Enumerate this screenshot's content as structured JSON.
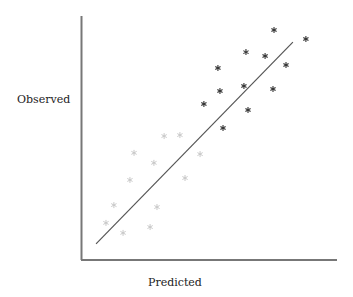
{
  "chart_data": {
    "type": "scatter",
    "title": "",
    "xlabel": "Predicted",
    "ylabel": "Observed",
    "xlim": [
      0,
      10
    ],
    "ylim": [
      0,
      10
    ],
    "grid": false,
    "ticks": "none",
    "legend": null,
    "marker": "asterisk",
    "series": [
      {
        "name": "dark points",
        "color": "#333333",
        "points": [
          [
            7.53,
            9.43
          ],
          [
            8.78,
            9.06
          ],
          [
            6.43,
            8.52
          ],
          [
            7.18,
            8.36
          ],
          [
            8.0,
            7.99
          ],
          [
            5.33,
            7.87
          ],
          [
            5.41,
            6.93
          ],
          [
            6.35,
            7.13
          ],
          [
            7.49,
            7.01
          ],
          [
            4.78,
            6.39
          ],
          [
            6.51,
            6.15
          ],
          [
            5.53,
            5.41
          ]
        ]
      },
      {
        "name": "light points",
        "color": "#c8c8c8",
        "points": [
          [
            3.22,
            5.08
          ],
          [
            3.84,
            5.12
          ],
          [
            2.04,
            4.39
          ],
          [
            2.82,
            3.98
          ],
          [
            4.63,
            4.34
          ],
          [
            1.88,
            3.28
          ],
          [
            4.04,
            3.36
          ],
          [
            1.25,
            2.25
          ],
          [
            2.94,
            2.17
          ],
          [
            0.94,
            1.52
          ],
          [
            2.67,
            1.35
          ],
          [
            1.61,
            1.11
          ]
        ]
      }
    ],
    "reference_line": {
      "name": "fit line",
      "color": "#555555",
      "from": [
        0.55,
        0.66
      ],
      "to": [
        8.27,
        8.93
      ]
    }
  },
  "labels": {
    "x_axis": "Predicted",
    "y_axis": "Observed"
  }
}
